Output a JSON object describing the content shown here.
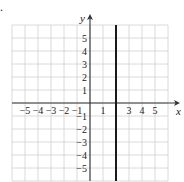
{
  "problem_marker": ".",
  "chart_data": {
    "type": "line",
    "title": "",
    "xlabel": "x",
    "ylabel": "y",
    "xlim": [
      -6,
      6
    ],
    "ylim": [
      -6,
      6
    ],
    "grid": true,
    "x_tick_labels": [
      "-5",
      "-4",
      "-3",
      "-2",
      "-1",
      "1",
      "3",
      "4",
      "5"
    ],
    "x_tick_values": [
      -5,
      -4,
      -3,
      -2,
      -1,
      1,
      3,
      4,
      5
    ],
    "y_tick_labels": [
      "5",
      "4",
      "3",
      "2",
      "1",
      "-1",
      "-2",
      "-3",
      "-4",
      "-5"
    ],
    "y_tick_values": [
      5,
      4,
      3,
      2,
      1,
      -1,
      -2,
      -3,
      -4,
      -5
    ],
    "series": [
      {
        "name": "x = 2",
        "kind": "vertical-line",
        "x": 2,
        "y_range": [
          -6,
          6
        ],
        "color": "#1a1a1a"
      }
    ],
    "colors": {
      "grid": "#d0d0d0",
      "axis": "#333333",
      "line": "#1a1a1a"
    }
  }
}
